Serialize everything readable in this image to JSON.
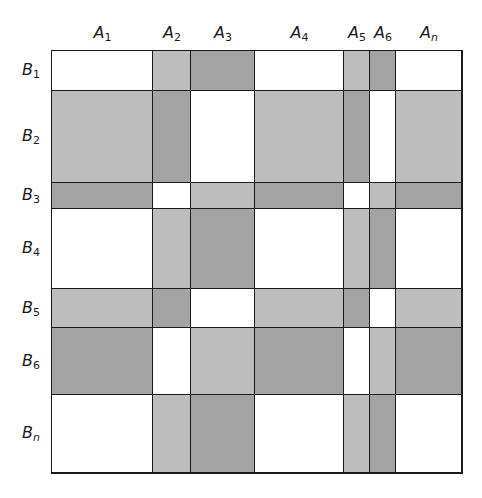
{
  "diagram": {
    "type": "block-partition-grid",
    "columns": [
      {
        "label": "A",
        "sub": "1",
        "x0": 52,
        "x1": 153
      },
      {
        "label": "A",
        "sub": "2",
        "x0": 153,
        "x1": 191
      },
      {
        "label": "A",
        "sub": "3",
        "x0": 191,
        "x1": 255
      },
      {
        "label": "A",
        "sub": "4",
        "x0": 255,
        "x1": 344
      },
      {
        "label": "A",
        "sub": "5",
        "x0": 344,
        "x1": 370
      },
      {
        "label": "A",
        "sub": "6",
        "x0": 370,
        "x1": 396
      },
      {
        "label": "A",
        "sub": "n",
        "x0": 396,
        "x1": 462
      }
    ],
    "rows": [
      {
        "label": "B",
        "sub": "1",
        "y0": 51,
        "y1": 91
      },
      {
        "label": "B",
        "sub": "2",
        "y0": 91,
        "y1": 183
      },
      {
        "label": "B",
        "sub": "3",
        "y0": 183,
        "y1": 209
      },
      {
        "label": "B",
        "sub": "4",
        "y0": 209,
        "y1": 289
      },
      {
        "label": "B",
        "sub": "5",
        "y0": 289,
        "y1": 328
      },
      {
        "label": "B",
        "sub": "6",
        "y0": 328,
        "y1": 395
      },
      {
        "label": "B",
        "sub": "n",
        "y0": 395,
        "y1": 473
      }
    ],
    "shading": [
      [
        "W",
        "L",
        "D",
        "W",
        "L",
        "D",
        "W"
      ],
      [
        "L",
        "D",
        "W",
        "L",
        "D",
        "W",
        "L"
      ],
      [
        "D",
        "W",
        "L",
        "D",
        "W",
        "L",
        "D"
      ],
      [
        "W",
        "L",
        "D",
        "W",
        "L",
        "D",
        "W"
      ],
      [
        "L",
        "D",
        "W",
        "L",
        "D",
        "W",
        "L"
      ],
      [
        "D",
        "W",
        "L",
        "D",
        "W",
        "L",
        "D"
      ],
      [
        "W",
        "L",
        "D",
        "W",
        "L",
        "D",
        "W"
      ]
    ],
    "legend_colors": {
      "W": "#ffffff",
      "L": "#bdbdbd",
      "D": "#a3a3a3"
    },
    "grid_line_color": "#1a1a1a",
    "column_label_y": 33,
    "row_label_x": 22
  }
}
